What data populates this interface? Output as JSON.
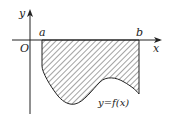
{
  "diagram": {
    "axes": {
      "x_label": "x",
      "y_label": "y",
      "origin_label": "O"
    },
    "points": {
      "a_label": "a",
      "b_label": "b"
    },
    "curve_label": "y=f(x)",
    "region": "shaded area between x-axis and curve y=f(x) from x=a to x=b, below x-axis",
    "colors": {
      "stroke": "#222222",
      "hatch": "#333333",
      "background": "#ffffff"
    }
  }
}
